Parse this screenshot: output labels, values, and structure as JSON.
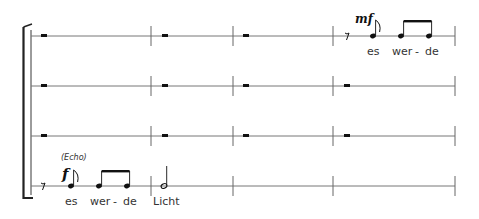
{
  "score": {
    "staves": [
      {
        "index": 1,
        "measures": [
          "rest",
          "rest",
          "rest",
          "notes"
        ]
      },
      {
        "index": 2,
        "measures": [
          "rest",
          "rest",
          "rest",
          ""
        ]
      },
      {
        "index": 3,
        "measures": [
          "rest",
          "rest",
          "rest",
          ""
        ]
      },
      {
        "index": 4,
        "measures": [
          "notes",
          "half-note",
          "",
          ""
        ]
      }
    ],
    "staff1": {
      "dynamic": "mf",
      "lyrics": [
        "es",
        "wer",
        "-",
        "de"
      ]
    },
    "staff4": {
      "annotation": "(Echo)",
      "dynamic": "f",
      "lyrics": [
        "es",
        "wer",
        "-",
        "de",
        "Licht"
      ]
    }
  }
}
